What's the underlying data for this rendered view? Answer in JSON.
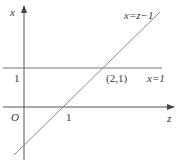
{
  "diagram": {
    "type": "coordinate-plane",
    "axes": {
      "horizontal": {
        "label": "z"
      },
      "vertical": {
        "label": "x"
      },
      "origin_label": "O"
    },
    "ticks": {
      "vertical_tick": "1",
      "horizontal_tick": "1"
    },
    "lines": [
      {
        "name": "line-x-equals-1",
        "label": "x=1",
        "equation": "x = 1"
      },
      {
        "name": "line-x-equals-z-minus-1",
        "label": "x=z−1",
        "equation": "x = z - 1"
      }
    ],
    "intersection": {
      "label": "(2,1)",
      "point": [
        2,
        1
      ]
    },
    "colors": {
      "axis": "#444444",
      "line": "#8a8a8a",
      "text": "#3a3a3a",
      "background": "#ffffff"
    }
  }
}
